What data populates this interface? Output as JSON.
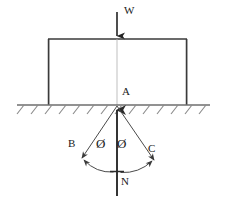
{
  "diagram": {
    "background_color": "#ffffff",
    "stroke_color": "#333333",
    "text_color": "#1a1a1a",
    "labels": {
      "weight": "W",
      "contact_point": "A",
      "left_cone_edge": "B",
      "right_cone_edge": "C",
      "normal_reaction": "N",
      "angle_left": "Ø",
      "angle_right": "Ø"
    },
    "geometry": {
      "ground_line_y": 105,
      "ground_line_x_start": 17,
      "ground_line_x_end": 210,
      "block_left": 48,
      "block_right": 187,
      "block_top": 39,
      "block_bottom": 105,
      "axis_x": 117,
      "weight_arrow_top": 12,
      "weight_arrow_bottom": 38,
      "normal_arrow_bottom": 196,
      "normal_arrow_tip": 103,
      "cone_b_end_x": 80,
      "cone_b_end_y": 160,
      "cone_c_end_x": 156,
      "cone_c_end_y": 162,
      "hatch_count": 14,
      "hatch_spacing": 14
    }
  }
}
